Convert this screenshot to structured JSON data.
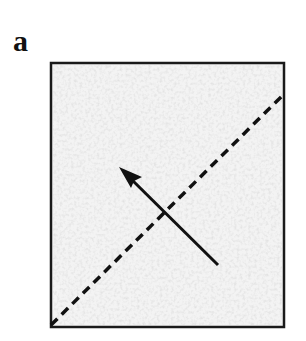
{
  "figure": {
    "panel_label": "a",
    "box": {
      "x": 51,
      "y": 63,
      "width": 233,
      "height": 264,
      "fill": "#f3f3f3",
      "stroke": "#1a1a1a",
      "stroke_width": 2.5
    },
    "dashed_line": {
      "x1": 51,
      "y1": 325,
      "x2": 283,
      "y2": 95,
      "stroke": "#111111",
      "stroke_width": 3.5,
      "dasharray": "9,6"
    },
    "arrow": {
      "x1": 218,
      "y1": 265,
      "x2": 120,
      "y2": 168,
      "stroke": "#111111",
      "stroke_width": 3
    },
    "colors": {
      "background": "#ffffff",
      "box_fill": "#f3f3f3",
      "ink": "#111111"
    }
  }
}
